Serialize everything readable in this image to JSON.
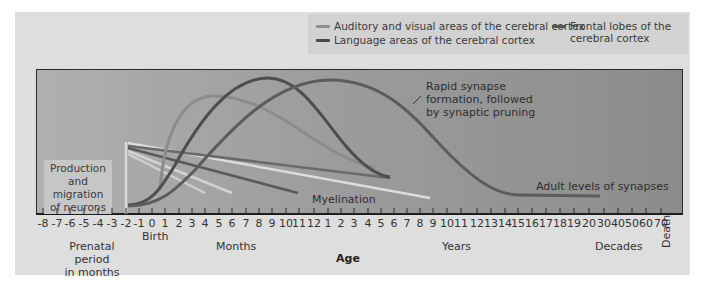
{
  "chart_data": {
    "type": "line",
    "title": "",
    "xlabel": "Age",
    "ylabel": "",
    "grid": false,
    "legend_position": "top-right",
    "x_ticks": [
      "-8",
      "-7",
      "-6",
      "-5",
      "-4",
      "-3",
      "-2",
      "-1",
      "0",
      "1",
      "2",
      "3",
      "4",
      "5",
      "6",
      "7",
      "8",
      "9",
      "10",
      "11",
      "12",
      "1",
      "2",
      "3",
      "4",
      "5",
      "6",
      "7",
      "8",
      "9",
      "10",
      "11",
      "12",
      "13",
      "14",
      "15",
      "16",
      "17",
      "18",
      "19",
      "20",
      "30",
      "40",
      "50",
      "60",
      "70"
    ],
    "x_groups": [
      {
        "label": "Prenatal period in months",
        "range": [
          "-8",
          "-1"
        ]
      },
      {
        "label": "Months",
        "range": [
          "0",
          "12"
        ]
      },
      {
        "label": "Years",
        "range": [
          "1",
          "20"
        ]
      },
      {
        "label": "Decades",
        "range": [
          "30",
          "70"
        ]
      }
    ],
    "x_markers": {
      "birth": "0",
      "end": "Death"
    },
    "series": [
      {
        "name": "Auditory and visual areas of the cerebral cortex",
        "color": "#8e8e8e",
        "peak_at": "4 months",
        "peak_level": 0.85
      },
      {
        "name": "Language areas of the cerebral cortex",
        "color": "#5a5a5a",
        "peak_at": "9 months",
        "peak_level": 1.0
      },
      {
        "name": "Frontal lobes of the cerebral cortex",
        "color": "#6a6a6a",
        "peak_at": "2-3 years",
        "peak_level": 0.98,
        "adult_level_from": "15 years"
      }
    ],
    "annotations": [
      "Production and migration of neurons",
      "Rapid synapse formation, followed by synaptic pruning",
      "Myelination",
      "Adult levels of synapses"
    ]
  },
  "legend": {
    "auditory": "Auditory and visual areas of the cerebral cortex",
    "language": "Language areas of the cerebral cortex",
    "frontal_line1": "Frontal lobes of the",
    "frontal_line2": "cerebral cortex",
    "colors": {
      "auditory": "#8e8e8e",
      "language": "#4a4a4a",
      "frontal": "#555555"
    }
  },
  "annotations": {
    "production_1": "Production",
    "production_2": "and migration",
    "production_3": "of neurons",
    "rapid_1": "Rapid synapse",
    "rapid_2": "formation, followed",
    "rapid_3": "by synaptic pruning",
    "myelination": "Myelination",
    "adult": "Adult levels of synapses"
  },
  "axis": {
    "birth": "Birth",
    "prenatal_1": "Prenatal period",
    "prenatal_2": "in months",
    "months": "Months",
    "years": "Years",
    "decades": "Decades",
    "age": "Age",
    "death": "Death",
    "ticks": [
      {
        "label": "-8",
        "x": 43
      },
      {
        "label": "-7",
        "x": 57
      },
      {
        "label": "-6",
        "x": 70
      },
      {
        "label": "-5",
        "x": 84
      },
      {
        "label": "-4",
        "x": 98
      },
      {
        "label": "-3",
        "x": 112
      },
      {
        "label": "-2",
        "x": 126
      },
      {
        "label": "-1",
        "x": 139
      },
      {
        "label": "0",
        "x": 152
      },
      {
        "label": "1",
        "x": 165
      },
      {
        "label": "2",
        "x": 179
      },
      {
        "label": "3",
        "x": 192
      },
      {
        "label": "4",
        "x": 205
      },
      {
        "label": "5",
        "x": 219
      },
      {
        "label": "6",
        "x": 232
      },
      {
        "label": "7",
        "x": 246
      },
      {
        "label": "8",
        "x": 259
      },
      {
        "label": "9",
        "x": 272
      },
      {
        "label": "10",
        "x": 286
      },
      {
        "label": "11",
        "x": 299
      },
      {
        "label": "12",
        "x": 314
      },
      {
        "label": "1",
        "x": 328
      },
      {
        "label": "2",
        "x": 341
      },
      {
        "label": "3",
        "x": 354
      },
      {
        "label": "4",
        "x": 368
      },
      {
        "label": "5",
        "x": 381
      },
      {
        "label": "6",
        "x": 394
      },
      {
        "label": "7",
        "x": 407
      },
      {
        "label": "8",
        "x": 420
      },
      {
        "label": "9",
        "x": 433
      },
      {
        "label": "10",
        "x": 447
      },
      {
        "label": "11",
        "x": 461
      },
      {
        "label": "12",
        "x": 477
      },
      {
        "label": "13",
        "x": 491
      },
      {
        "label": "14",
        "x": 505
      },
      {
        "label": "15",
        "x": 518
      },
      {
        "label": "16",
        "x": 532
      },
      {
        "label": "17",
        "x": 546
      },
      {
        "label": "18",
        "x": 560
      },
      {
        "label": "19",
        "x": 574
      },
      {
        "label": "20",
        "x": 589
      },
      {
        "label": "30",
        "x": 604
      },
      {
        "label": "40",
        "x": 618
      },
      {
        "label": "50",
        "x": 632
      },
      {
        "label": "60",
        "x": 646
      },
      {
        "label": "70",
        "x": 661
      }
    ]
  }
}
